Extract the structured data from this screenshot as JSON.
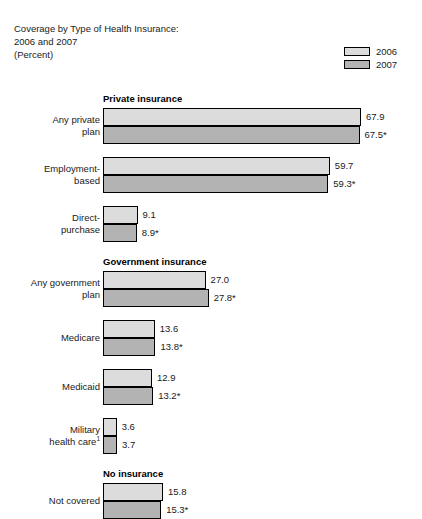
{
  "title": {
    "line1": "Coverage by Type of Health Insurance:",
    "line2": "2006 and 2007",
    "line3": "(Percent)"
  },
  "legend": {
    "items": [
      {
        "label": "2006",
        "color": "#dcdcdc"
      },
      {
        "label": "2007",
        "color": "#b3b3b3"
      }
    ]
  },
  "footnote_marker": "1",
  "chart_data": {
    "type": "bar",
    "orientation": "horizontal",
    "title": "Coverage by Type of Health Insurance: 2006 and 2007 (Percent)",
    "xlabel": "Percent",
    "ylabel": "",
    "xlim": [
      0,
      70
    ],
    "grid": false,
    "legend_position": "top-right",
    "series": [
      {
        "name": "2006",
        "color": "#dcdcdc"
      },
      {
        "name": "2007",
        "color": "#b3b3b3"
      }
    ],
    "sections": [
      {
        "header": "Private insurance",
        "categories": [
          {
            "label_line1": "Any private",
            "label_line2": "plan",
            "values": [
              67.9,
              67.5
            ],
            "value_labels": [
              "67.9",
              "67.5*"
            ]
          },
          {
            "label_line1": "Employment-",
            "label_line2": "based",
            "values": [
              59.7,
              59.3
            ],
            "value_labels": [
              "59.7",
              "59.3*"
            ]
          },
          {
            "label_line1": "Direct-",
            "label_line2": "purchase",
            "values": [
              9.1,
              8.9
            ],
            "value_labels": [
              "9.1",
              "8.9*"
            ]
          }
        ]
      },
      {
        "header": "Government insurance",
        "categories": [
          {
            "label_line1": "Any government",
            "label_line2": "plan",
            "values": [
              27.0,
              27.8
            ],
            "value_labels": [
              "27.0",
              "27.8*"
            ]
          },
          {
            "label_line1": "Medicare",
            "label_line2": "",
            "values": [
              13.6,
              13.8
            ],
            "value_labels": [
              "13.6",
              "13.8*"
            ]
          },
          {
            "label_line1": "Medicaid",
            "label_line2": "",
            "values": [
              12.9,
              13.2
            ],
            "value_labels": [
              "12.9",
              "13.2*"
            ]
          },
          {
            "label_line1": "Military",
            "label_line2": "health care",
            "label_line2_sup": "1",
            "values": [
              3.6,
              3.7
            ],
            "value_labels": [
              "3.6",
              "3.7"
            ]
          }
        ]
      },
      {
        "header": "No insurance",
        "categories": [
          {
            "label_line1": "Not covered",
            "label_line2": "",
            "values": [
              15.8,
              15.3
            ],
            "value_labels": [
              "15.8",
              "15.3*"
            ]
          }
        ]
      }
    ]
  }
}
